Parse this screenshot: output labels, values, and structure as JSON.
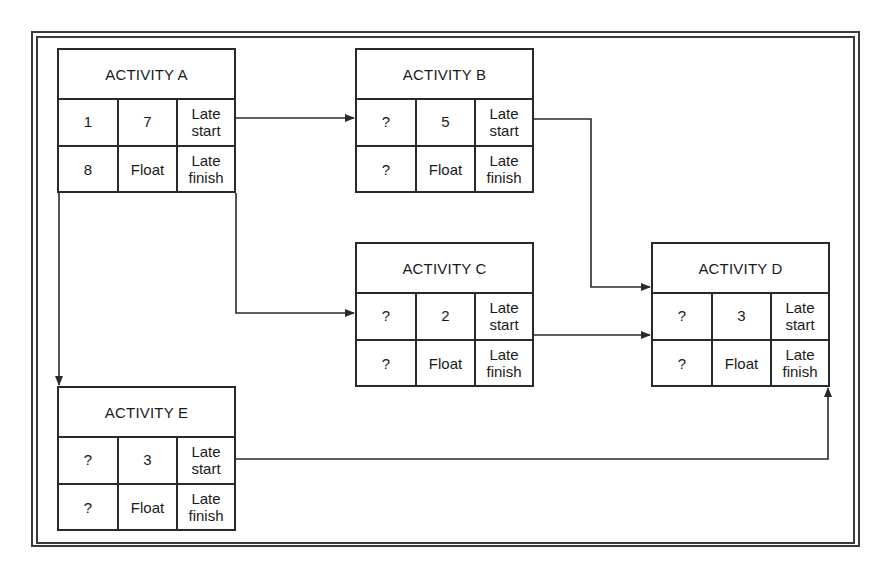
{
  "diagram": {
    "type": "activity-on-node network",
    "cell_legend": {
      "late_start": "Late\nstart",
      "late_finish": "Late\nfinish",
      "float": "Float"
    },
    "nodes": [
      {
        "id": "A",
        "title": "ACTIVITY A",
        "early_start": "1",
        "duration": "7",
        "early_finish": "8",
        "late_start_label": "Late\nstart",
        "float_label": "Float",
        "late_finish_label": "Late\nfinish"
      },
      {
        "id": "B",
        "title": "ACTIVITY B",
        "early_start": "?",
        "duration": "5",
        "early_finish": "?",
        "late_start_label": "Late\nstart",
        "float_label": "Float",
        "late_finish_label": "Late\nfinish"
      },
      {
        "id": "C",
        "title": "ACTIVITY C",
        "early_start": "?",
        "duration": "2",
        "early_finish": "?",
        "late_start_label": "Late\nstart",
        "float_label": "Float",
        "late_finish_label": "Late\nfinish"
      },
      {
        "id": "D",
        "title": "ACTIVITY D",
        "early_start": "?",
        "duration": "3",
        "early_finish": "?",
        "late_start_label": "Late\nstart",
        "float_label": "Float",
        "late_finish_label": "Late\nfinish"
      },
      {
        "id": "E",
        "title": "ACTIVITY E",
        "early_start": "?",
        "duration": "3",
        "early_finish": "?",
        "late_start_label": "Late\nstart",
        "float_label": "Float",
        "late_finish_label": "Late\nfinish"
      }
    ],
    "edges": [
      {
        "from": "A",
        "to": "B"
      },
      {
        "from": "A",
        "to": "C"
      },
      {
        "from": "A",
        "to": "E"
      },
      {
        "from": "B",
        "to": "D"
      },
      {
        "from": "C",
        "to": "D"
      },
      {
        "from": "E",
        "to": "D"
      }
    ],
    "colors": {
      "line": "#2a2a2a",
      "background": "#ffffff"
    }
  }
}
